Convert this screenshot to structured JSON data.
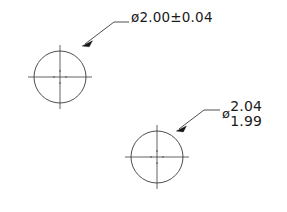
{
  "drawing": {
    "title": "Circle diameter tolerance callouts",
    "background_color": "#ffffff",
    "line_color": "#3a3a3a",
    "text_color": "#1a1a1a",
    "features": [
      {
        "name": "circle-1",
        "center_x": 60,
        "center_y": 77,
        "radius": 26,
        "center_mark": "crosshair"
      },
      {
        "name": "circle-2",
        "center_x": 157,
        "center_y": 157,
        "radius": 26,
        "center_mark": "crosshair"
      }
    ]
  },
  "callouts": [
    {
      "name": "callout-diameter-symmetric",
      "diameter_symbol": "ø",
      "text": "ø2.00±0.04",
      "nominal": "2.00",
      "tolerance": "±0.04",
      "tolerance_type": "symmetric",
      "leader_target": "circle-1"
    },
    {
      "name": "callout-diameter-limits",
      "diameter_symbol": "ø",
      "upper_limit": "2.04",
      "lower_limit": "1.99",
      "tolerance_type": "limit",
      "leader_target": "circle-2"
    }
  ]
}
